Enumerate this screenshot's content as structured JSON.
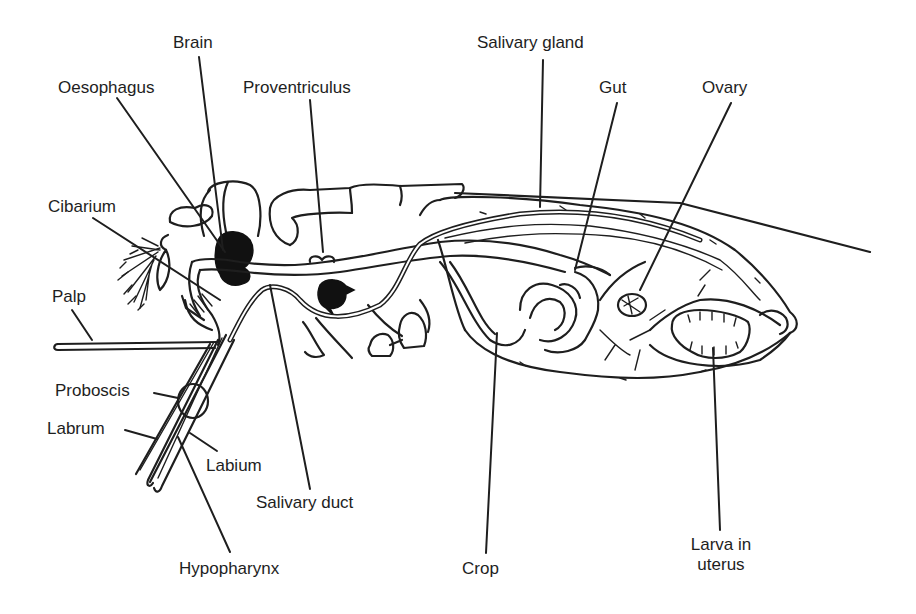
{
  "diagram": {
    "labels": [
      {
        "id": "brain",
        "text": "Brain",
        "x": 173,
        "y": 33,
        "align": "left"
      },
      {
        "id": "oesophagus",
        "text": "Oesophagus",
        "x": 58,
        "y": 78,
        "align": "left"
      },
      {
        "id": "proventriculus",
        "text": "Proventriculus",
        "x": 243,
        "y": 78,
        "align": "left"
      },
      {
        "id": "salivary-gland",
        "text": "Salivary gland",
        "x": 477,
        "y": 33,
        "align": "left"
      },
      {
        "id": "gut",
        "text": "Gut",
        "x": 599,
        "y": 78,
        "align": "left"
      },
      {
        "id": "ovary",
        "text": "Ovary",
        "x": 702,
        "y": 78,
        "align": "left"
      },
      {
        "id": "cibarium",
        "text": "Cibarium",
        "x": 48,
        "y": 197,
        "align": "left"
      },
      {
        "id": "palp",
        "text": "Palp",
        "x": 52,
        "y": 287,
        "align": "left"
      },
      {
        "id": "proboscis",
        "text": "Proboscis",
        "x": 55,
        "y": 381,
        "align": "left"
      },
      {
        "id": "labrum",
        "text": "Labrum",
        "x": 47,
        "y": 419,
        "align": "left"
      },
      {
        "id": "labium",
        "text": "Labium",
        "x": 206,
        "y": 456,
        "align": "left"
      },
      {
        "id": "salivary-duct",
        "text": "Salivary duct",
        "x": 256,
        "y": 493,
        "align": "left"
      },
      {
        "id": "hypopharynx",
        "text": "Hypopharynx",
        "x": 179,
        "y": 559,
        "align": "left"
      },
      {
        "id": "crop",
        "text": "Crop",
        "x": 462,
        "y": 559,
        "align": "left"
      },
      {
        "id": "larva-in-uterus",
        "text": "Larva in\nuterus",
        "x": 721,
        "y": 535,
        "align": "center"
      }
    ],
    "leader_lines": [
      {
        "target": "brain",
        "x1": 199,
        "y1": 57,
        "x2": 223,
        "y2": 250
      },
      {
        "target": "oesophagus",
        "x1": 117,
        "y1": 98,
        "x2": 225,
        "y2": 252
      },
      {
        "target": "proventriculus",
        "x1": 310,
        "y1": 100,
        "x2": 323,
        "y2": 252
      },
      {
        "target": "salivary-gland",
        "x1": 543,
        "y1": 60,
        "x2": 540,
        "y2": 207
      },
      {
        "target": "gut",
        "x1": 617,
        "y1": 103,
        "x2": 575,
        "y2": 270
      },
      {
        "target": "ovary",
        "x1": 731,
        "y1": 103,
        "x2": 640,
        "y2": 290
      },
      {
        "target": "cibarium",
        "x1": 93,
        "y1": 218,
        "x2": 220,
        "y2": 300
      },
      {
        "target": "palp",
        "x1": 72,
        "y1": 310,
        "x2": 92,
        "y2": 340
      },
      {
        "target": "proboscis",
        "x1": 154,
        "y1": 393,
        "x2": 178,
        "y2": 398
      },
      {
        "target": "labrum",
        "x1": 125,
        "y1": 430,
        "x2": 157,
        "y2": 439
      },
      {
        "target": "labium",
        "x1": 217,
        "y1": 451,
        "x2": 190,
        "y2": 433
      },
      {
        "target": "salivary-duct",
        "x1": 310,
        "y1": 489,
        "x2": 270,
        "y2": 285
      },
      {
        "target": "hypopharynx",
        "x1": 230,
        "y1": 552,
        "x2": 178,
        "y2": 437
      },
      {
        "target": "crop",
        "x1": 486,
        "y1": 553,
        "x2": 497,
        "y2": 333
      },
      {
        "target": "larva-in-uterus",
        "x1": 720,
        "y1": 530,
        "x2": 713,
        "y2": 348
      }
    ]
  }
}
